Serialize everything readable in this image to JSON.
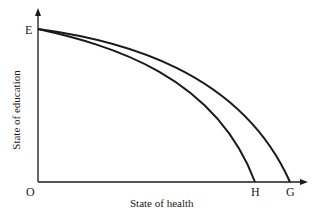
{
  "diagram": {
    "type": "production possibility frontier",
    "xlabel": "State of health",
    "ylabel": "State of education",
    "points": {
      "origin": "O",
      "y_intercept": "E",
      "inner_x_intercept": "H",
      "outer_x_intercept": "G"
    },
    "curves": [
      {
        "name": "EH",
        "from": "E",
        "to": "H"
      },
      {
        "name": "EG",
        "from": "E",
        "to": "G"
      }
    ],
    "colors": {
      "line": "#1a1a1a",
      "background": "#ffffff"
    }
  }
}
